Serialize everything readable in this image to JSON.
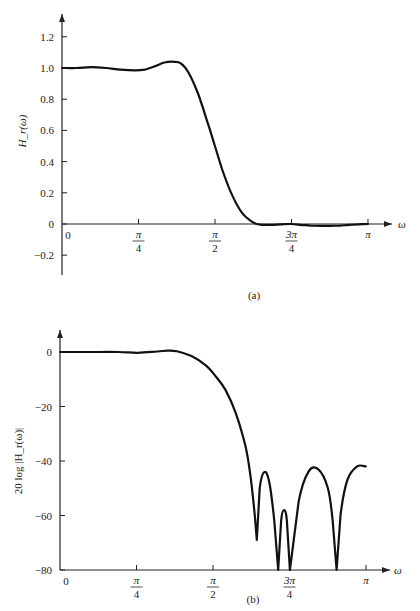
{
  "chart_data": [
    {
      "type": "line",
      "panel": "(a)",
      "title": "",
      "xlabel": "ω",
      "ylabel": "H_r(ω)",
      "xlim": [
        0,
        3.14159
      ],
      "ylim": [
        -0.3,
        1.3
      ],
      "x_ticks": [
        {
          "value": 0,
          "label": "0"
        },
        {
          "value": 0.7854,
          "label": "π/4"
        },
        {
          "value": 1.5708,
          "label": "π/2"
        },
        {
          "value": 2.3562,
          "label": "3π/4"
        },
        {
          "value": 3.14159,
          "label": "π"
        }
      ],
      "y_ticks": [
        1.2,
        1.0,
        0.8,
        0.6,
        0.4,
        0.2,
        0,
        -0.2
      ],
      "y_tick_labels": [
        "1.2",
        "1.0",
        "0.8",
        "0.6",
        "0.4",
        "0.2",
        "0",
        "−0.2"
      ],
      "grid": false,
      "series": [
        {
          "name": "H_r(ω)",
          "x": [
            0,
            0.15,
            0.3,
            0.45,
            0.6,
            0.75,
            0.85,
            0.95,
            1.05,
            1.15,
            1.22,
            1.3,
            1.4,
            1.5,
            1.57,
            1.65,
            1.75,
            1.85,
            1.95,
            2.0,
            2.05,
            2.15,
            2.25,
            2.35,
            2.45,
            2.55,
            2.65,
            2.75,
            2.85,
            2.95,
            3.05,
            3.14
          ],
          "values": [
            1.0,
            1.0,
            1.005,
            1.0,
            0.99,
            0.985,
            0.99,
            1.01,
            1.035,
            1.04,
            1.03,
            0.97,
            0.83,
            0.64,
            0.5,
            0.34,
            0.18,
            0.07,
            0.015,
            0.0,
            -0.005,
            -0.005,
            -0.002,
            0.0,
            -0.005,
            -0.01,
            -0.012,
            -0.012,
            -0.01,
            -0.006,
            -0.002,
            0.0
          ]
        }
      ]
    },
    {
      "type": "line",
      "panel": "(b)",
      "title": "",
      "xlabel": "ω",
      "ylabel": "20 log |H_r(ω)|",
      "xlim": [
        0,
        3.14159
      ],
      "ylim": [
        -80,
        5
      ],
      "x_ticks": [
        {
          "value": 0,
          "label": "0"
        },
        {
          "value": 0.7854,
          "label": "π/4"
        },
        {
          "value": 1.5708,
          "label": "π/2"
        },
        {
          "value": 2.3562,
          "label": "3π/4"
        },
        {
          "value": 3.14159,
          "label": "π"
        }
      ],
      "y_ticks": [
        0,
        -20,
        -40,
        -60,
        -80
      ],
      "y_tick_labels": [
        "0",
        "−20",
        "−40",
        "−60",
        "−80"
      ],
      "grid": false,
      "series": [
        {
          "name": "20 log |H_r(ω)| (dB)",
          "x": [
            0,
            0.3,
            0.6,
            0.8,
            1.0,
            1.1,
            1.2,
            1.35,
            1.5,
            1.6,
            1.7,
            1.8,
            1.9,
            1.95,
            2.0,
            2.02,
            2.05,
            2.1,
            2.15,
            2.2,
            2.24,
            2.27,
            2.3,
            2.33,
            2.36,
            2.45,
            2.55,
            2.65,
            2.75,
            2.8,
            2.84,
            2.88,
            2.95,
            3.05,
            3.14
          ],
          "values": [
            0,
            0,
            0,
            -0.3,
            0.2,
            0.5,
            0.3,
            -1.5,
            -5,
            -9,
            -14,
            -22,
            -34,
            -44,
            -60,
            -69,
            -50,
            -44,
            -48,
            -62,
            -80,
            -62,
            -58,
            -62,
            -80,
            -55,
            -44,
            -43,
            -50,
            -62,
            -80,
            -60,
            -47,
            -42,
            -42
          ]
        }
      ],
      "annotations": [
        "stopband nulls near ω ≈ 2.02, 2.24, 2.36, 2.84"
      ]
    }
  ],
  "labels": {
    "panel_a": "(a)",
    "panel_b": "(b)",
    "omega": "ω",
    "ylabel_a": "H_r(ω)",
    "ylabel_b": "20 log |H_r(ω)|"
  }
}
